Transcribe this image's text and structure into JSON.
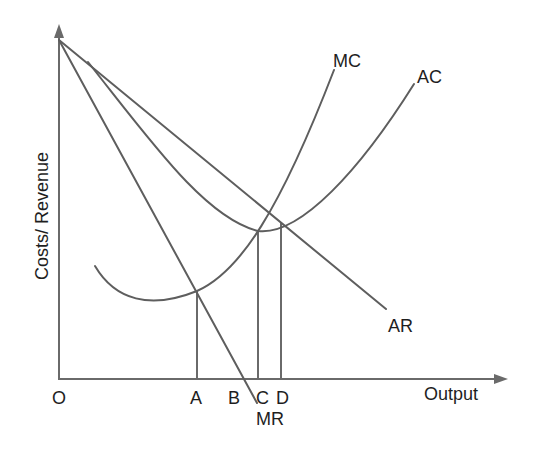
{
  "diagram": {
    "type": "economics-cost-revenue-diagram",
    "y_axis_label": "Costs/ Revenue",
    "x_axis_label": "Output",
    "origin_label": "O",
    "curves": {
      "mc": {
        "label": "MC",
        "description": "Marginal cost curve (U-shaped, steep rise)"
      },
      "ac": {
        "label": "AC",
        "description": "Average cost curve (U-shaped, minimum cut by MC)"
      },
      "ar": {
        "label": "AR",
        "description": "Average revenue (demand), straight downward line"
      },
      "mr": {
        "label": "MR",
        "description": "Marginal revenue, straight line steeper than AR"
      }
    },
    "output_points": [
      {
        "label": "A",
        "meaning": "MC = MR"
      },
      {
        "label": "B",
        "meaning": "MR = 0"
      },
      {
        "label": "C",
        "meaning": "MC = AC (minimum AC)"
      },
      {
        "label": "D",
        "meaning": "AR = AC"
      }
    ],
    "colors": {
      "line": "#5e5e5e",
      "axis": "#6a6a6a",
      "text": "#1e1e1e",
      "background": "#ffffff"
    }
  }
}
